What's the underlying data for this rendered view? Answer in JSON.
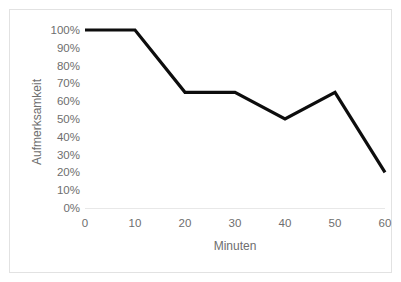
{
  "chart_data": {
    "type": "line",
    "title": "",
    "xlabel": "Minuten",
    "ylabel": "Aufmerksamkeit",
    "x": [
      0,
      10,
      20,
      30,
      40,
      50,
      60
    ],
    "values": [
      100,
      100,
      65,
      65,
      50,
      65,
      20
    ],
    "series": [
      {
        "name": "Aufmerksamkeit",
        "values": [
          100,
          100,
          65,
          65,
          50,
          65,
          20
        ]
      }
    ],
    "xlim": [
      0,
      60
    ],
    "ylim": [
      0,
      100
    ],
    "x_tick_labels": [
      "0",
      "10",
      "20",
      "30",
      "40",
      "50",
      "60"
    ],
    "y_tick_labels": [
      "0%",
      "10%",
      "20%",
      "30%",
      "40%",
      "50%",
      "60%",
      "70%",
      "80%",
      "90%",
      "100%"
    ],
    "y_tick_values": [
      0,
      10,
      20,
      30,
      40,
      50,
      60,
      70,
      80,
      90,
      100
    ],
    "grid": false,
    "legend": "none",
    "line_color": "#0d0d0d",
    "tick_label_color": "#6e6e6e",
    "axis_line_color": "#e8e8e8",
    "border_color": "#e2e2e2",
    "background_color": "#ffffff"
  }
}
